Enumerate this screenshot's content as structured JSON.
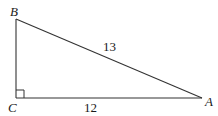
{
  "figure": {
    "type": "right-triangle",
    "stroke_color": "#333333",
    "vertices": {
      "B": {
        "label": "B",
        "x": 16,
        "y": 19
      },
      "C": {
        "label": "C",
        "x": 16,
        "y": 98
      },
      "A": {
        "label": "A",
        "x": 202,
        "y": 98
      }
    },
    "right_angle_at": "C",
    "sides": {
      "AB": {
        "label": "13"
      },
      "CA": {
        "label": "12"
      }
    }
  }
}
